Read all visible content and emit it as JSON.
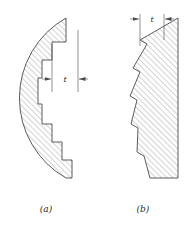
{
  "figure": {
    "background_color": "#ffffff",
    "line_color": "#4a4a4a",
    "hatch_color": "#8a8a8a",
    "text_color": "#2b2b2b",
    "panels": [
      {
        "id": "a",
        "caption": "(a)",
        "caption_x": 46,
        "caption_y": 212,
        "description": "stepped staircase approximation of curved profile",
        "dimension": {
          "label": "t",
          "label_x": 65,
          "label_y": 82,
          "line_y": 79,
          "left_x": 52,
          "right_x": 78,
          "ext_left_x": 52,
          "ext_left_y1": 44,
          "ext_left_y2": 90,
          "ext_right_x": 78,
          "ext_right_y1": 30,
          "ext_right_y2": 90
        },
        "outline_points": "66,18 66,42 52,42 52,60 42,60 42,78 38,78 38,104 42,104 42,124 52,124 52,142 62,142 62,160 72,160 72,178 66,178",
        "arc": {
          "start_x": 66,
          "start_y": 18,
          "end_x": 66,
          "end_y": 178,
          "bulge_x": 6,
          "radius": 92
        }
      },
      {
        "id": "b",
        "caption": "(b)",
        "caption_x": 143,
        "caption_y": 212,
        "description": "serrated sawtooth approximation of curved profile",
        "dimension": {
          "label": "t",
          "label_x": 152,
          "label_y": 22,
          "line_y": 19,
          "left_x": 140,
          "right_x": 164,
          "ext_left_x": 140,
          "ext_left_y1": 14,
          "ext_left_y2": 46,
          "ext_right_x": 164,
          "ext_right_y1": 14,
          "ext_right_y2": 40
        },
        "right_edge_x": 178,
        "top_y": 18,
        "bottom_y": 178,
        "teeth": [
          {
            "valley_x": 140,
            "valley_y": 44,
            "notch_y": 40
          },
          {
            "valley_x": 133,
            "valley_y": 72,
            "notch_y": 68
          },
          {
            "valley_x": 130,
            "valley_y": 100,
            "notch_y": 96
          },
          {
            "valley_x": 131,
            "valley_y": 128,
            "notch_y": 124
          },
          {
            "valley_x": 137,
            "valley_y": 156,
            "notch_y": 152
          }
        ]
      }
    ]
  }
}
